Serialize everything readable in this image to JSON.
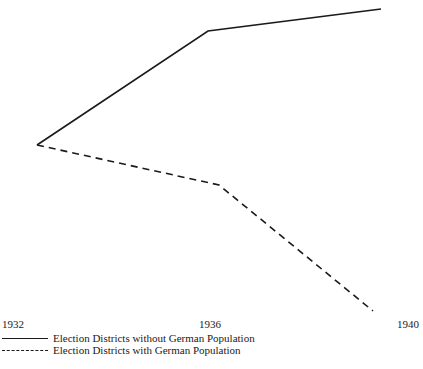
{
  "chart_data": {
    "type": "line",
    "title": "",
    "xlabel": "",
    "ylabel": "",
    "categories": [
      "1932",
      "1936",
      "1940"
    ],
    "grid": false,
    "legend_position": "bottom-left",
    "series": [
      {
        "name": "Election Districts without German Population",
        "style": "solid",
        "points_px": [
          [
            37,
            145
          ],
          [
            208,
            31
          ],
          [
            381,
            9
          ]
        ],
        "relative_values": [
          0,
          64,
          76
        ]
      },
      {
        "name": "Election Districts with German Population",
        "style": "dashed",
        "points_px": [
          [
            37,
            145
          ],
          [
            219,
            185
          ],
          [
            373,
            311
          ]
        ],
        "relative_values": [
          0,
          -22,
          -93
        ]
      }
    ]
  },
  "ticks": {
    "t0": "1932",
    "t1": "1936",
    "t2": "1940"
  },
  "legend": {
    "solid_label": "Election Districts without German Population",
    "dashed_label": "Election Districts with German Population"
  },
  "colors": {
    "line": "#1a1a1a",
    "background": "#ffffff"
  }
}
